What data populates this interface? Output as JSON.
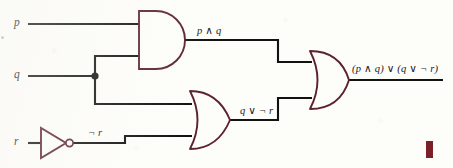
{
  "figure": {
    "kind": "logic-circuit-diagram",
    "background_color": "#fdfdfa",
    "wire_color": "#121212",
    "gate_outline_color": "#5c2230",
    "marker_color": "#7d1f28"
  },
  "inputs": [
    {
      "id": "p",
      "label": "p",
      "y": 24
    },
    {
      "id": "q",
      "label": "q",
      "y": 76
    },
    {
      "id": "r",
      "label": "r",
      "y": 143
    }
  ],
  "gates": [
    {
      "id": "and1",
      "type": "AND",
      "symbol_name": "and-gate",
      "output_label": "p ∧ q"
    },
    {
      "id": "or1",
      "type": "OR",
      "symbol_name": "or-gate",
      "output_label": "q ∨ ¬ r"
    },
    {
      "id": "or2",
      "type": "OR",
      "symbol_name": "or-gate",
      "output_label": "(p ∧ q) ∨ (q ∨ ¬ r)"
    },
    {
      "id": "not1",
      "type": "NOT",
      "symbol_name": "not-gate",
      "output_label": "¬ r"
    }
  ],
  "wire_labels": {
    "and_out": "p ∧ q",
    "or_out": "q ∨ ¬ r",
    "not_out": "¬ r",
    "final_out": "(p ∧ q) ∨ (q ∨ ¬ r)"
  },
  "junctions": [
    {
      "id": "q-fanout",
      "x": 95,
      "y": 76
    }
  ]
}
